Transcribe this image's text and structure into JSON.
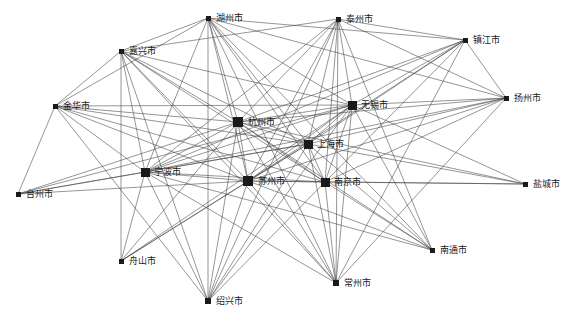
{
  "figure": {
    "type": "network-graph",
    "title": "",
    "background_color": "#ffffff",
    "node_color": "#1a1a1a",
    "edge_color": "#404040",
    "label_color": "#1a1a1a"
  },
  "graph_data": {
    "type": "network",
    "directed": false,
    "node_count": 18,
    "edge_count": 103,
    "nodes": [
      {
        "id": "huzhou",
        "label": "湖州市",
        "x": 208,
        "y": 18,
        "size": 5,
        "label_dx": 8,
        "label_dy": 0
      },
      {
        "id": "taizhou_js",
        "label": "泰州市",
        "x": 338,
        "y": 19,
        "size": 5,
        "label_dx": 8,
        "label_dy": 0
      },
      {
        "id": "zhenjiang",
        "label": "镇江市",
        "x": 465,
        "y": 40,
        "size": 5,
        "label_dx": 8,
        "label_dy": 0
      },
      {
        "id": "jiaxing",
        "label": "嘉兴市",
        "x": 121,
        "y": 51,
        "size": 5,
        "label_dx": 8,
        "label_dy": 0
      },
      {
        "id": "yangzhou",
        "label": "扬州市",
        "x": 506,
        "y": 98,
        "size": 5,
        "label_dx": 8,
        "label_dy": 0
      },
      {
        "id": "wuxi",
        "label": "无锡市",
        "x": 352,
        "y": 105,
        "size": 9,
        "label_dx": 9,
        "label_dy": 0
      },
      {
        "id": "jinhua",
        "label": "金华市",
        "x": 55,
        "y": 106,
        "size": 5,
        "label_dx": 8,
        "label_dy": 0
      },
      {
        "id": "hangzhou",
        "label": "杭州市",
        "x": 238,
        "y": 122,
        "size": 10,
        "label_dx": 10,
        "label_dy": 0
      },
      {
        "id": "shanghai",
        "label": "上海市",
        "x": 308,
        "y": 144,
        "size": 9,
        "label_dx": 9,
        "label_dy": 0
      },
      {
        "id": "ningbo",
        "label": "宁波市",
        "x": 145,
        "y": 172,
        "size": 9,
        "label_dx": 9,
        "label_dy": 0
      },
      {
        "id": "suzhou",
        "label": "苏州市",
        "x": 248,
        "y": 181,
        "size": 10,
        "label_dx": 10,
        "label_dy": 0
      },
      {
        "id": "nanjing",
        "label": "南京市",
        "x": 325,
        "y": 182,
        "size": 9,
        "label_dx": 9,
        "label_dy": 0
      },
      {
        "id": "yancheng",
        "label": "盐城市",
        "x": 525,
        "y": 184,
        "size": 5,
        "label_dx": 8,
        "label_dy": 0
      },
      {
        "id": "taizhou_zj",
        "label": "台州市",
        "x": 18,
        "y": 194,
        "size": 5,
        "label_dx": 8,
        "label_dy": 0
      },
      {
        "id": "nantong",
        "label": "南通市",
        "x": 432,
        "y": 250,
        "size": 5,
        "label_dx": 8,
        "label_dy": 0
      },
      {
        "id": "zhoushan",
        "label": "舟山市",
        "x": 121,
        "y": 261,
        "size": 5,
        "label_dx": 8,
        "label_dy": 0
      },
      {
        "id": "changzhou",
        "label": "常州市",
        "x": 336,
        "y": 283,
        "size": 6,
        "label_dx": 8,
        "label_dy": 0
      },
      {
        "id": "shaoxing",
        "label": "绍兴市",
        "x": 208,
        "y": 301,
        "size": 6,
        "label_dx": 8,
        "label_dy": 0
      }
    ],
    "edges": [
      [
        "huzhou",
        "jiaxing"
      ],
      [
        "huzhou",
        "hangzhou"
      ],
      [
        "huzhou",
        "shanghai"
      ],
      [
        "huzhou",
        "suzhou"
      ],
      [
        "huzhou",
        "wuxi"
      ],
      [
        "huzhou",
        "nanjing"
      ],
      [
        "huzhou",
        "ningbo"
      ],
      [
        "huzhou",
        "changzhou"
      ],
      [
        "huzhou",
        "shaoxing"
      ],
      [
        "huzhou",
        "yangzhou"
      ],
      [
        "huzhou",
        "zhenjiang"
      ],
      [
        "huzhou",
        "nantong"
      ],
      [
        "huzhou",
        "jinhua"
      ],
      [
        "taizhou_js",
        "hangzhou"
      ],
      [
        "taizhou_js",
        "shanghai"
      ],
      [
        "taizhou_js",
        "suzhou"
      ],
      [
        "taizhou_js",
        "wuxi"
      ],
      [
        "taizhou_js",
        "nanjing"
      ],
      [
        "taizhou_js",
        "ningbo"
      ],
      [
        "taizhou_js",
        "changzhou"
      ],
      [
        "taizhou_js",
        "yangzhou"
      ],
      [
        "taizhou_js",
        "zhenjiang"
      ],
      [
        "taizhou_js",
        "nantong"
      ],
      [
        "taizhou_js",
        "shaoxing"
      ],
      [
        "taizhou_js",
        "jiaxing"
      ],
      [
        "zhenjiang",
        "wuxi"
      ],
      [
        "zhenjiang",
        "shanghai"
      ],
      [
        "zhenjiang",
        "suzhou"
      ],
      [
        "zhenjiang",
        "nanjing"
      ],
      [
        "zhenjiang",
        "hangzhou"
      ],
      [
        "zhenjiang",
        "changzhou"
      ],
      [
        "zhenjiang",
        "ningbo"
      ],
      [
        "zhenjiang",
        "yangzhou"
      ],
      [
        "jiaxing",
        "hangzhou"
      ],
      [
        "jiaxing",
        "shanghai"
      ],
      [
        "jiaxing",
        "suzhou"
      ],
      [
        "jiaxing",
        "wuxi"
      ],
      [
        "jiaxing",
        "nanjing"
      ],
      [
        "jiaxing",
        "ningbo"
      ],
      [
        "jiaxing",
        "shaoxing"
      ],
      [
        "jiaxing",
        "zhoushan"
      ],
      [
        "jiaxing",
        "jinhua"
      ],
      [
        "jiaxing",
        "changzhou"
      ],
      [
        "yangzhou",
        "wuxi"
      ],
      [
        "yangzhou",
        "shanghai"
      ],
      [
        "yangzhou",
        "suzhou"
      ],
      [
        "yangzhou",
        "nanjing"
      ],
      [
        "yangzhou",
        "hangzhou"
      ],
      [
        "yangzhou",
        "ningbo"
      ],
      [
        "yangzhou",
        "changzhou"
      ],
      [
        "wuxi",
        "hangzhou"
      ],
      [
        "wuxi",
        "shanghai"
      ],
      [
        "wuxi",
        "suzhou"
      ],
      [
        "wuxi",
        "nanjing"
      ],
      [
        "wuxi",
        "ningbo"
      ],
      [
        "wuxi",
        "changzhou"
      ],
      [
        "wuxi",
        "nantong"
      ],
      [
        "wuxi",
        "shaoxing"
      ],
      [
        "wuxi",
        "zhoushan"
      ],
      [
        "wuxi",
        "yancheng"
      ],
      [
        "wuxi",
        "jinhua"
      ],
      [
        "wuxi",
        "taizhou_zj"
      ],
      [
        "jinhua",
        "hangzhou"
      ],
      [
        "jinhua",
        "shanghai"
      ],
      [
        "jinhua",
        "suzhou"
      ],
      [
        "jinhua",
        "ningbo"
      ],
      [
        "jinhua",
        "nanjing"
      ],
      [
        "jinhua",
        "taizhou_zj"
      ],
      [
        "jinhua",
        "shaoxing"
      ],
      [
        "hangzhou",
        "shanghai"
      ],
      [
        "hangzhou",
        "suzhou"
      ],
      [
        "hangzhou",
        "nanjing"
      ],
      [
        "hangzhou",
        "ningbo"
      ],
      [
        "hangzhou",
        "changzhou"
      ],
      [
        "hangzhou",
        "shaoxing"
      ],
      [
        "hangzhou",
        "zhoushan"
      ],
      [
        "hangzhou",
        "nantong"
      ],
      [
        "hangzhou",
        "taizhou_zj"
      ],
      [
        "hangzhou",
        "yancheng"
      ],
      [
        "shanghai",
        "suzhou"
      ],
      [
        "shanghai",
        "nanjing"
      ],
      [
        "shanghai",
        "ningbo"
      ],
      [
        "shanghai",
        "changzhou"
      ],
      [
        "shanghai",
        "shaoxing"
      ],
      [
        "shanghai",
        "zhoushan"
      ],
      [
        "shanghai",
        "nantong"
      ],
      [
        "shanghai",
        "taizhou_zj"
      ],
      [
        "shanghai",
        "yancheng"
      ],
      [
        "ningbo",
        "suzhou"
      ],
      [
        "ningbo",
        "nanjing"
      ],
      [
        "ningbo",
        "shaoxing"
      ],
      [
        "ningbo",
        "zhoushan"
      ],
      [
        "ningbo",
        "taizhou_zj"
      ],
      [
        "ningbo",
        "changzhou"
      ],
      [
        "ningbo",
        "nantong"
      ],
      [
        "suzhou",
        "nanjing"
      ],
      [
        "suzhou",
        "changzhou"
      ],
      [
        "suzhou",
        "shaoxing"
      ],
      [
        "suzhou",
        "zhoushan"
      ],
      [
        "suzhou",
        "nantong"
      ],
      [
        "suzhou",
        "taizhou_zj"
      ],
      [
        "suzhou",
        "yancheng"
      ],
      [
        "nanjing",
        "changzhou"
      ],
      [
        "nanjing",
        "nantong"
      ],
      [
        "nanjing",
        "yancheng"
      ],
      [
        "nanjing",
        "shaoxing"
      ]
    ]
  }
}
